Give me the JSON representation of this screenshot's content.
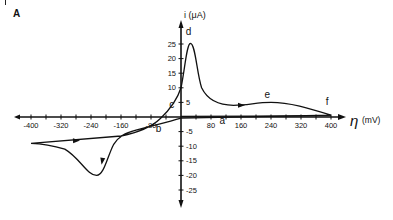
{
  "panel_label": "A",
  "chart_data": {
    "type": "line",
    "title": "",
    "panel": "A",
    "xlabel": "η (mV)",
    "ylabel": "i (μA)",
    "x_axis_symbol": "η",
    "x_axis_unit": "(mV)",
    "y_axis_label": "i (μA)",
    "xlim": [
      -420,
      420
    ],
    "ylim": [
      -30,
      30
    ],
    "grid": false,
    "legend": "none",
    "x_ticks": [
      -400,
      -320,
      -240,
      -160,
      -80,
      80,
      160,
      240,
      320,
      400
    ],
    "x_tick_labels": [
      "-400",
      "-320",
      "-240",
      "-160",
      "-80",
      "80",
      "160",
      "240",
      "320",
      "400"
    ],
    "y_ticks": [
      5,
      10,
      15,
      20,
      25,
      -5,
      -10,
      -15,
      -20,
      -25
    ],
    "y_tick_labels": [
      "5",
      "10",
      "15",
      "20",
      "25",
      "-5",
      "-10",
      "-15",
      "-20",
      "-25"
    ],
    "annotations": [
      {
        "label": "a",
        "x": 110,
        "y": -2.5
      },
      {
        "label": "b",
        "x": -60,
        "y": -5
      },
      {
        "label": "c",
        "x": -25,
        "y": 3
      },
      {
        "label": "d",
        "x": 20,
        "y": 28
      },
      {
        "label": "e",
        "x": 230,
        "y": 6.5
      },
      {
        "label": "f",
        "x": 390,
        "y": 4
      }
    ],
    "series": [
      {
        "name": "Cyclic voltammogram",
        "description": "Anodic sweep from -400 mV through peak d (~25 μA at ~+25 mV) then broad shoulder e (~5 μA at ~+240 mV) to f (+400 mV); cathodic return along baseline through a and b to cathodic peak (~-20 μA at ~-230 mV), back to -400 mV.",
        "x": [
          -400,
          -320,
          -240,
          -160,
          -100,
          -60,
          -30,
          0,
          15,
          25,
          40,
          60,
          100,
          160,
          240,
          320,
          400,
          320,
          160,
          80,
          0,
          -80,
          -160,
          -200,
          -230,
          -260,
          -320,
          -400
        ],
        "y": [
          -9,
          -8.5,
          -8,
          -6.5,
          -3.5,
          -1,
          2.5,
          10,
          20,
          25,
          20,
          10,
          5,
          4,
          5,
          3,
          0.5,
          0.3,
          -0.3,
          -1,
          -2,
          -4,
          -6.5,
          -14,
          -20,
          -17,
          -11,
          -9
        ]
      }
    ]
  }
}
